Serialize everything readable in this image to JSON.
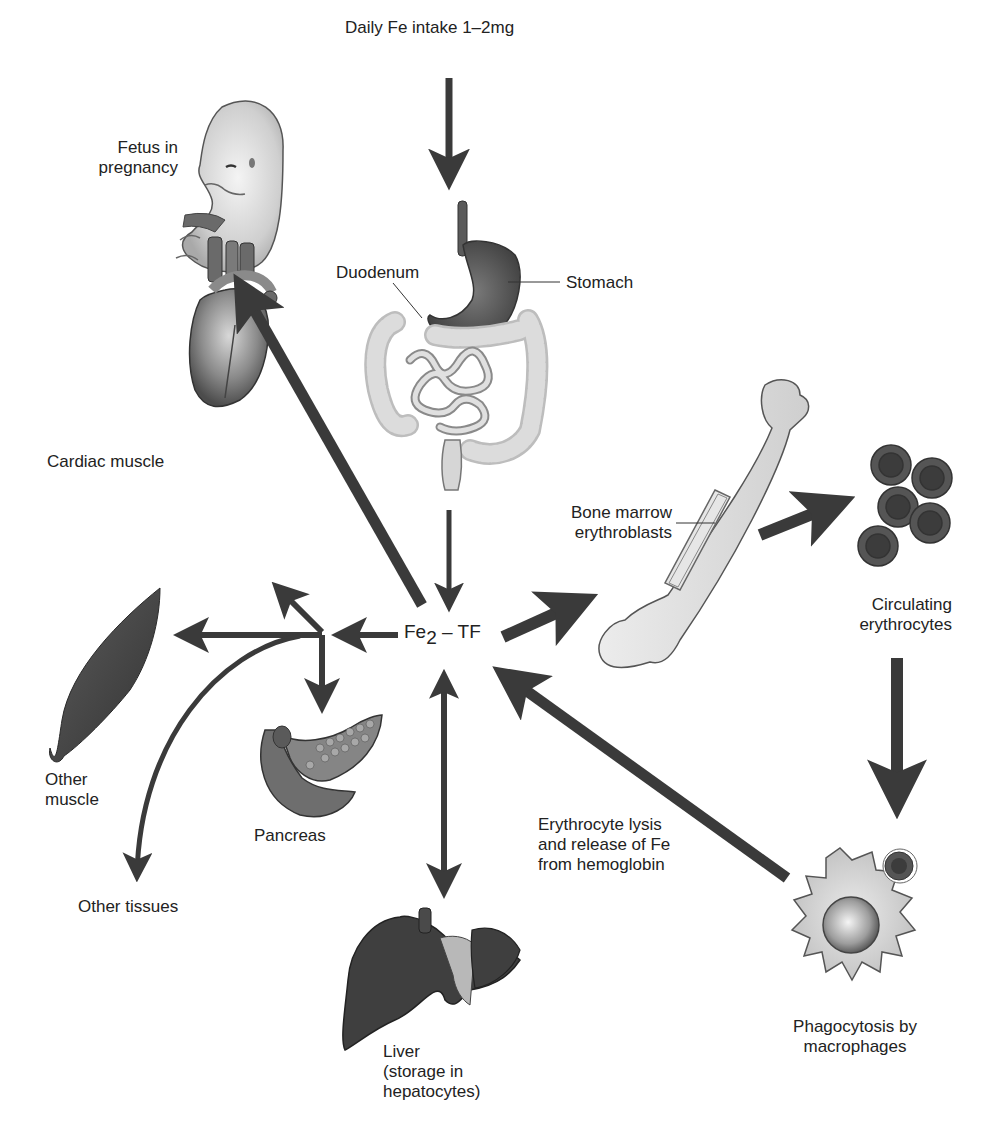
{
  "diagram": {
    "center_node": {
      "prefix": "Fe",
      "subscript": "2",
      "suffix": " – TF"
    },
    "labels": {
      "intake": "Daily Fe intake 1–2mg",
      "fetus_line1": "Fetus in",
      "fetus_line2": "pregnancy",
      "duodenum": "Duodenum",
      "stomach": "Stomach",
      "cardiac": "Cardiac muscle",
      "bone_line1": "Bone marrow",
      "bone_line2": "erythroblasts",
      "circ_line1": "Circulating",
      "circ_line2": "erythrocytes",
      "other_muscle_line1": "Other",
      "other_muscle_line2": "muscle",
      "pancreas": "Pancreas",
      "other_tissues": "Other tissues",
      "lysis_line1": "Erythrocyte lysis",
      "lysis_line2": "and release of Fe",
      "lysis_line3": "from hemoglobin",
      "liver_line1": "Liver",
      "liver_line2": "(storage in",
      "liver_line3": "hepatocytes)",
      "phago_line1": "Phagocytosis by",
      "phago_line2": "macrophages"
    },
    "nodes": [
      "Daily Fe intake",
      "Stomach",
      "Duodenum",
      "Fe2-TF",
      "Fetus in pregnancy",
      "Cardiac muscle",
      "Other muscle",
      "Pancreas",
      "Other tissues",
      "Liver",
      "Bone marrow erythroblasts",
      "Circulating erythrocytes",
      "Phagocytosis by macrophages"
    ],
    "edges": [
      {
        "from": "Daily Fe intake",
        "to": "Stomach"
      },
      {
        "from": "Duodenum",
        "to": "Fe2-TF"
      },
      {
        "from": "Fe2-TF",
        "to": "Fetus in pregnancy"
      },
      {
        "from": "Fe2-TF",
        "to": "Cardiac muscle"
      },
      {
        "from": "Fe2-TF",
        "to": "Other muscle"
      },
      {
        "from": "Fe2-TF",
        "to": "Pancreas"
      },
      {
        "from": "Fe2-TF",
        "to": "Other tissues"
      },
      {
        "from": "Fe2-TF",
        "to": "Liver",
        "bidirectional": true
      },
      {
        "from": "Fe2-TF",
        "to": "Bone marrow erythroblasts"
      },
      {
        "from": "Bone marrow erythroblasts",
        "to": "Circulating erythrocytes"
      },
      {
        "from": "Circulating erythrocytes",
        "to": "Phagocytosis by macrophages"
      },
      {
        "from": "Phagocytosis by macrophages",
        "to": "Fe2-TF"
      }
    ],
    "colors": {
      "arrow": "#3a3a3a",
      "organ_dark": "#4a4a4a",
      "organ_light": "#d6d6d6",
      "background": "#ffffff"
    }
  }
}
